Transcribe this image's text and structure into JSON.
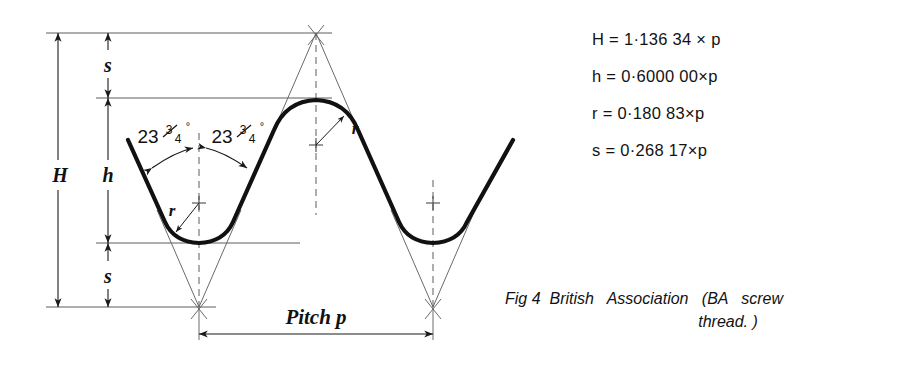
{
  "figure": {
    "caption_prefix": "Fig 4",
    "caption_line_1": "British   Association   (BA   screw",
    "caption_line_2": "thread. )"
  },
  "formulas": [
    {
      "id": "H",
      "text": "H = 1·136 34 × p"
    },
    {
      "id": "h",
      "text": "h = 0·6000 00×p"
    },
    {
      "id": "r",
      "text": "r = 0·180 83×p"
    },
    {
      "id": "s",
      "text": "s = 0·268 17×p"
    }
  ],
  "dimensions": {
    "total_depth": "H",
    "thread_depth": "h",
    "truncation_top": "s",
    "truncation_bottom": "s",
    "radius_crest": "r",
    "radius_root": "r",
    "pitch": "Pitch p"
  },
  "angles": {
    "left_whole": "23",
    "left_frac_num": "3",
    "left_frac_den": "4",
    "left_degree": "°",
    "right_whole": "23",
    "right_frac_num": "3",
    "right_frac_den": "4",
    "right_degree": "°",
    "full_value": "23¾°"
  },
  "colors": {
    "profile": "#111111",
    "construction": "#6a6a6a",
    "text": "#121212",
    "background": "#ffffff"
  }
}
